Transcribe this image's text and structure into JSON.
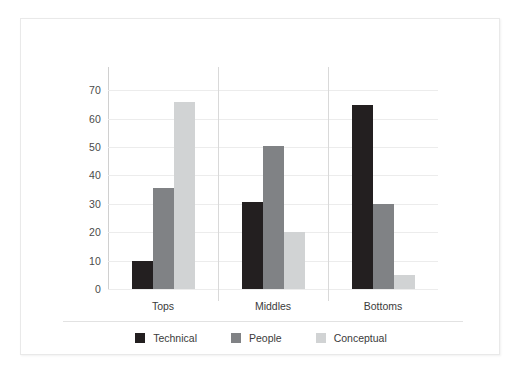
{
  "chart_data": {
    "type": "bar",
    "title": "",
    "subtitle": "",
    "xlabel": "",
    "ylabel": "",
    "categories": [
      "Tops",
      "Middles",
      "Bottoms"
    ],
    "series": [
      {
        "name": "Technical",
        "color": "#231f20",
        "values": [
          10,
          30.5,
          65
        ]
      },
      {
        "name": "People",
        "color": "#808285",
        "values": [
          35.5,
          50.5,
          30
        ]
      },
      {
        "name": "Conceptual",
        "color": "#d1d3d4",
        "values": [
          66,
          20,
          5
        ]
      }
    ],
    "ylim": [
      0,
      74
    ],
    "yticks": [
      0,
      10,
      20,
      30,
      40,
      50,
      60,
      70
    ],
    "ytick_labels": [
      "0",
      "10",
      "20",
      "30",
      "40",
      "50",
      "60",
      "70"
    ],
    "grid": true,
    "grid_axis": "y",
    "legend_position": "bottom",
    "category_separators": true
  },
  "colors": {
    "frame_border": "#e9e9e9",
    "gridline": "#ececec",
    "axis": "#d0d0d0",
    "text": "#3b3b3b",
    "legend_separator": "#e2e2e2",
    "background": "#ffffff"
  }
}
